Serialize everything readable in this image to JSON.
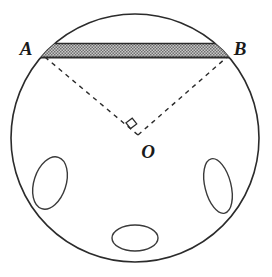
{
  "figure": {
    "name": "circle-with-chord-and-central-right-angle",
    "stroke_color": "#2b2b2b",
    "background_color": "#ffffff",
    "band_fill_color": "#b8b8b8",
    "band_stipple_color": "#6e6e6e",
    "labels": {
      "point_a": "A",
      "point_b": "B",
      "point_o": "O"
    },
    "geometry": {
      "circle": {
        "cx": 135,
        "cy": 138,
        "r": 124
      },
      "point_a": {
        "x": 45,
        "y": 57
      },
      "point_b": {
        "x": 227,
        "y": 57
      },
      "point_o": {
        "x": 138,
        "y": 135
      },
      "chord_top_y": 43,
      "chord_bottom_y": 59,
      "right_angle_marker": {
        "x": 128,
        "y": 122,
        "size": 9
      },
      "ellipses": [
        {
          "name": "left-ellipse",
          "cx": 50,
          "cy": 183,
          "rx": 16,
          "ry": 27,
          "rotation": 18
        },
        {
          "name": "right-ellipse",
          "cx": 218,
          "cy": 186,
          "rx": 13,
          "ry": 28,
          "rotation": -14
        },
        {
          "name": "bottom-ellipse",
          "cx": 135,
          "cy": 238,
          "rx": 23,
          "ry": 13,
          "rotation": 0
        }
      ]
    },
    "label_positions": {
      "a": {
        "x": 26,
        "y": 49
      },
      "b": {
        "x": 234,
        "y": 51
      },
      "o": {
        "x": 142,
        "y": 156
      }
    }
  }
}
